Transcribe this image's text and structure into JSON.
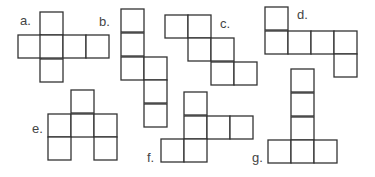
{
  "diagram": {
    "colors": {
      "stroke": "#333333",
      "fill": "#ffffff",
      "label": "#444444"
    },
    "cell_size": 23,
    "nets": [
      {
        "label": "a.",
        "label_pos": [
          20,
          25
        ],
        "squares": [
          [
            40,
            12
          ],
          [
            18,
            35
          ],
          [
            40,
            35
          ],
          [
            63,
            35
          ],
          [
            86,
            35
          ],
          [
            40,
            59
          ]
        ]
      },
      {
        "label": "b.",
        "label_pos": [
          99,
          26
        ],
        "squares": [
          [
            121,
            9
          ],
          [
            121,
            33
          ],
          [
            121,
            57
          ],
          [
            144,
            57
          ],
          [
            144,
            80
          ],
          [
            144,
            104
          ]
        ]
      },
      {
        "label": "c.",
        "label_pos": [
          220,
          28
        ],
        "squares": [
          [
            165,
            15
          ],
          [
            188,
            15
          ],
          [
            188,
            38
          ],
          [
            211,
            38
          ],
          [
            211,
            62
          ],
          [
            234,
            62
          ]
        ]
      },
      {
        "label": "d.",
        "label_pos": [
          297,
          19
        ],
        "squares": [
          [
            265,
            7
          ],
          [
            265,
            31
          ],
          [
            288,
            31
          ],
          [
            311,
            31
          ],
          [
            334,
            31
          ],
          [
            334,
            54
          ]
        ]
      },
      {
        "label": "e.",
        "label_pos": [
          32,
          133
        ],
        "squares": [
          [
            71,
            90
          ],
          [
            48,
            114
          ],
          [
            71,
            114
          ],
          [
            94,
            114
          ],
          [
            48,
            137
          ],
          [
            94,
            137
          ]
        ]
      },
      {
        "label": "f.",
        "label_pos": [
          147,
          162
        ],
        "squares": [
          [
            184,
            92
          ],
          [
            184,
            116
          ],
          [
            207,
            116
          ],
          [
            230,
            116
          ],
          [
            161,
            139
          ],
          [
            184,
            139
          ]
        ]
      },
      {
        "label": "g.",
        "label_pos": [
          252,
          162
        ],
        "squares": [
          [
            291,
            69
          ],
          [
            291,
            93
          ],
          [
            291,
            117
          ],
          [
            268,
            140
          ],
          [
            291,
            140
          ],
          [
            314,
            140
          ]
        ]
      }
    ]
  }
}
